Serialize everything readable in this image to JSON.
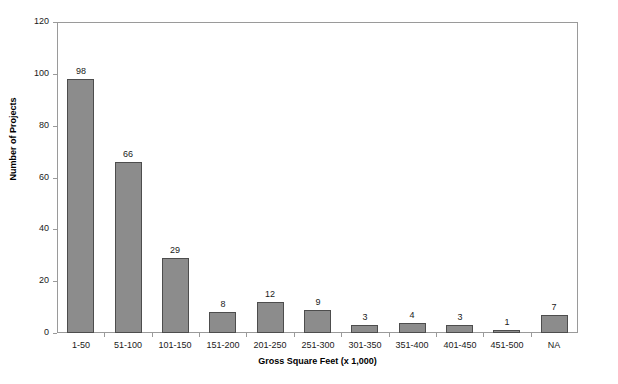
{
  "chart_data": {
    "type": "bar",
    "title": "",
    "xlabel": "Gross Square Feet (x 1,000)",
    "ylabel": "Number of Projects",
    "categories": [
      "1-50",
      "51-100",
      "101-150",
      "151-200",
      "201-250",
      "251-300",
      "301-350",
      "351-400",
      "401-450",
      "451-500",
      "NA"
    ],
    "values": [
      98,
      66,
      29,
      8,
      12,
      9,
      3,
      4,
      3,
      1,
      7
    ],
    "value_labels": [
      "98",
      "66",
      "29",
      "8",
      "12",
      "9",
      "3",
      "4",
      "3",
      "1",
      "7"
    ],
    "ylim": [
      0,
      120
    ],
    "yticks": [
      0,
      20,
      40,
      60,
      80,
      100,
      120
    ],
    "ytick_labels": [
      "0",
      "20",
      "40",
      "60",
      "80",
      "100",
      "120"
    ],
    "grid": false,
    "legend": "none",
    "bar_color": "#8c8c8c",
    "bar_border_color": "#4d4d4d",
    "axis_color": "#9a9a9a",
    "text_color": "#1a1a1a"
  }
}
